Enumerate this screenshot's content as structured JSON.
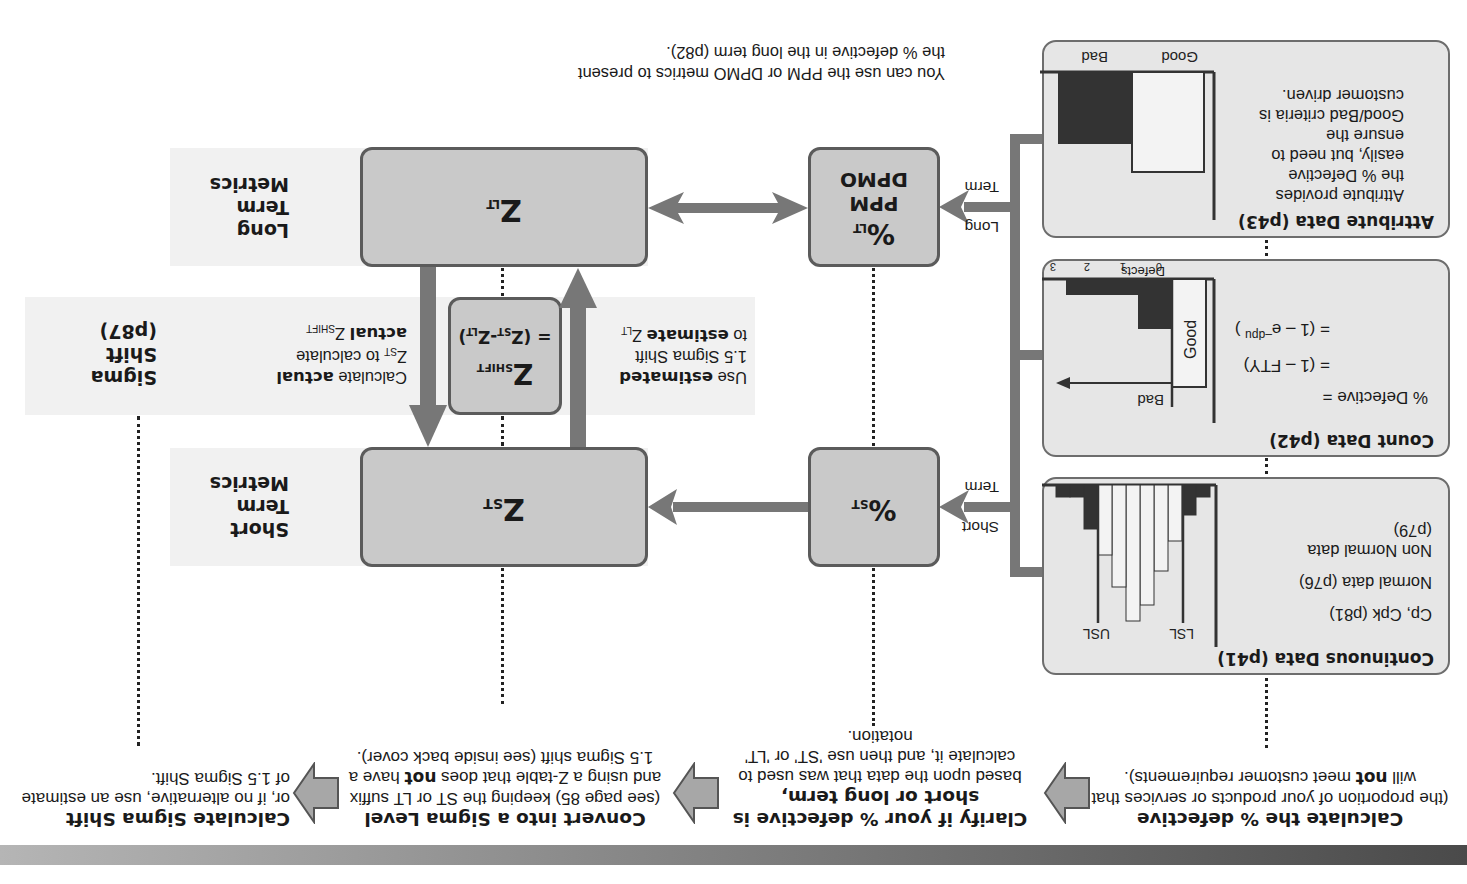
{
  "orientation": "rotated-180",
  "steps": [
    {
      "title": "Calculate the % defective",
      "desc_before": "(the proportion of your products or services that will ",
      "desc_bold": "not",
      "desc_after": " meet customer requirements)."
    },
    {
      "title": "Clarify if your % defective is short or long term,",
      "desc": "based upon the data that was used to calculate it, and then use 'ST' or 'LT' notation."
    },
    {
      "title": "Convert into a Sigma Level",
      "desc_before": "(see page 85) keeping the ST or LT suffix and using a Z-table that does ",
      "desc_bold": "not",
      "desc_after": " have a 1.5 Sigma shift (see inside back cover)."
    },
    {
      "title": "Calculate Sigma Shift",
      "desc": "or, if no alternative, use an estimate of 1.5 Sigma Shift."
    }
  ],
  "data_boxes": {
    "continuous": {
      "title": "Continuous Data (p41)",
      "lines": [
        "Cp, Cpk (p81)",
        "Normal data (p76)",
        "Non Normal data",
        "(p79)"
      ],
      "chart": {
        "lsl_label": "LSL",
        "usl_label": "USL"
      }
    },
    "count": {
      "title": "Count Data (p42)",
      "formula_lines": [
        "% Defective =",
        "= (1 – FTY)",
        "= (1 – e"
      ],
      "formula_sup": "–dpu",
      "formula_close": " )",
      "chart": {
        "good_label": "Good",
        "bad_label": "Bad",
        "axis_label": "Defects",
        "ticks": [
          "0",
          "1",
          "2",
          "3"
        ]
      }
    },
    "attribute": {
      "title": "Attribute Data (p43)",
      "lines": [
        "Attribute provides",
        "the % Defective",
        "easily, but need to",
        "ensure the",
        "Good/Bad criteria is",
        "customer driven."
      ],
      "chart": {
        "good_label": "Good",
        "bad_label": "Bad"
      }
    }
  },
  "branches": {
    "short": {
      "line1": "Short",
      "line2": "Term"
    },
    "long": {
      "line1": "Long",
      "line2": "Term"
    }
  },
  "nodes": {
    "pct_st": {
      "main": "%",
      "sub": "ST"
    },
    "pct_lt": {
      "main": "%",
      "sub": "LT",
      "line2": "PPM",
      "line3": "DPMO"
    },
    "z_st": {
      "main": "Z",
      "sub": "ST"
    },
    "z_lt": {
      "main": "Z",
      "sub": "LT"
    },
    "z_shift": {
      "main": "Z",
      "sub": "SHIFT",
      "eq": "= (Z",
      "eq_sub1": "ST",
      "eq_mid": "-Z",
      "eq_sub2": "LT",
      "eq_close": ")"
    }
  },
  "metric_labels": {
    "short_term": [
      "Short",
      "Term",
      "Metrics"
    ],
    "sigma_shift": [
      "Sigma",
      "Shift",
      "(p87)"
    ],
    "long_term": [
      "Long",
      "Term",
      "Metrics"
    ]
  },
  "shift_notes": {
    "estimate": {
      "l1_a": "Use ",
      "l1_b": "estimated",
      "l2": "1.5 Sigma Shift",
      "l3_a": "to ",
      "l3_b": "estimate",
      "l3_c": " Z",
      "l3_sub": "LT"
    },
    "actual": {
      "l1_a": "Calculate ",
      "l1_b": "actual",
      "l2_a": "Z",
      "l2_sub": "ST",
      "l2_b": " to calculate",
      "l3_a": "actual",
      "l3_b": " Z",
      "l3_sub": "SHIFT"
    }
  },
  "footer_note": [
    "You can use the PPM or DPMO metrics to present",
    "the % defective in the long term (p82)."
  ],
  "colors": {
    "box_fill": "#e6e6e6",
    "node_fill": "#c9c9c9",
    "connector": "#777777",
    "dark_bar": "#333333",
    "band": "#f1f1f1"
  }
}
